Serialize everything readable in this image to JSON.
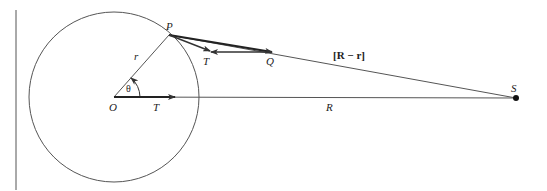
{
  "diagram": {
    "type": "geometry",
    "labels": {
      "P": "P",
      "O": "O",
      "r": "r",
      "theta": "θ",
      "T_center": "T",
      "T_top": "T",
      "Q": "Q",
      "R": "R",
      "S": "S",
      "R_minus_r": "[R − r]"
    },
    "elements": {
      "circle": {
        "center": [
          114,
          97
        ],
        "radius": 85
      },
      "left_rule": {
        "x": 16,
        "y1": 10,
        "y2": 190
      },
      "points": {
        "O": [
          114,
          97
        ],
        "P": [
          169,
          35
        ],
        "T_tip": [
          210,
          52
        ],
        "Q": [
          272,
          52
        ],
        "S": [
          516,
          98
        ]
      },
      "segments": [
        {
          "name": "O-P radius r",
          "from": "O",
          "to": "P"
        },
        {
          "name": "O-S distance R",
          "from": "O",
          "to": "S"
        },
        {
          "name": "P-S vector R-r",
          "from": "P",
          "to": "S"
        },
        {
          "name": "O-T arrow",
          "from": "O",
          "to": [
            175,
            97
          ],
          "arrow": true
        },
        {
          "name": "P-Q arrow",
          "from": "P",
          "to": "Q",
          "arrow": true
        },
        {
          "name": "P-T arrow",
          "from": "P",
          "to": "T_tip",
          "arrow": true
        },
        {
          "name": "Q-T arrow",
          "from": "Q",
          "to": "T_tip",
          "arrow": true
        }
      ],
      "angle": {
        "vertex": "O",
        "label": "θ",
        "between": [
          "O-S",
          "O-P"
        ]
      }
    },
    "colors": {
      "line": "#555555",
      "thick": "#222222",
      "text": "#222222"
    }
  }
}
